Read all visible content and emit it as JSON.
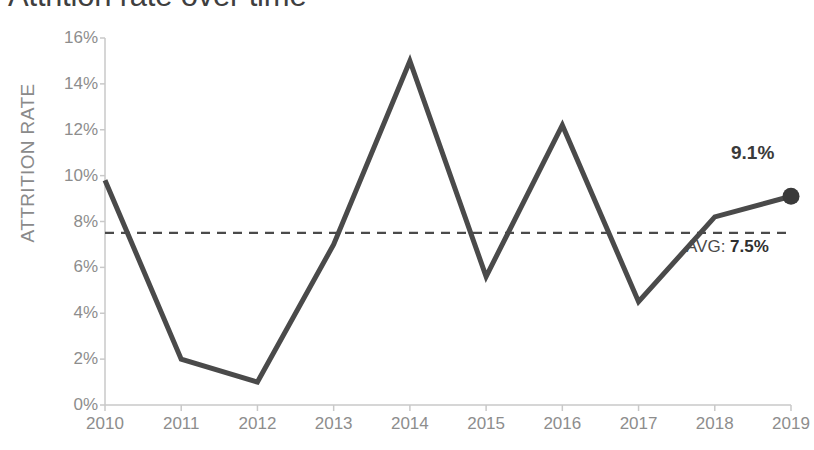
{
  "chart_data": {
    "type": "line",
    "title": "Attrition rate over time",
    "xlabel": "",
    "ylabel": "ATTRITION RATE",
    "categories": [
      "2010",
      "2011",
      "2012",
      "2013",
      "2014",
      "2015",
      "2016",
      "2017",
      "2018",
      "2019"
    ],
    "values": [
      9.8,
      2.0,
      1.0,
      7.0,
      15.0,
      5.6,
      12.2,
      4.5,
      8.2,
      9.1
    ],
    "series": [
      {
        "name": "Attrition rate",
        "values": [
          9.8,
          2.0,
          1.0,
          7.0,
          15.0,
          5.6,
          12.2,
          4.5,
          8.2,
          9.1
        ]
      }
    ],
    "ylim": [
      0,
      16
    ],
    "ytick_values": [
      0,
      2,
      4,
      6,
      8,
      10,
      12,
      14,
      16
    ],
    "ytick_labels": [
      "0%",
      "2%",
      "4%",
      "6%",
      "8%",
      "10%",
      "12%",
      "14%",
      "16%"
    ],
    "grid": false,
    "legend": "none",
    "reference_line": {
      "label_prefix": "AVG: ",
      "label_value": "7.5%",
      "value": 7.5,
      "style": "dashed"
    },
    "end_marker": {
      "category": "2019",
      "value": 9.1,
      "label": "9.1%"
    }
  },
  "colors": {
    "line": "#4a4a4a",
    "marker": "#3a3a3a",
    "avg_line": "#4a4a4a",
    "axis": "#c9c9c9",
    "tick_text": "#8d8d8d",
    "axis_title": "#8a8a8a",
    "title_text": "#3f3f3f",
    "background": "#ffffff"
  }
}
